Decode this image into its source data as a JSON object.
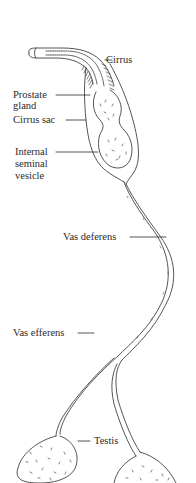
{
  "diagram": {
    "labels": {
      "cirrus": "Cirrus",
      "prostate_gland_line1": "Prostate",
      "prostate_gland_line2": "gland",
      "cirrus_sac": "Cirrus sac",
      "internal_seminal_vesicle_line1": "Internal",
      "internal_seminal_vesicle_line2": "seminal",
      "internal_seminal_vesicle_line3": "vesicle",
      "vas_deferens": "Vas deferens",
      "vas_efferens": "Vas efferens",
      "testis": "Testis"
    },
    "colors": {
      "line": "#2a2a2a",
      "background": "#ffffff"
    }
  }
}
